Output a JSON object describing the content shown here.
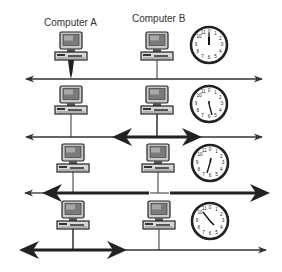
{
  "labels": {
    "computer_a": "Computer A",
    "computer_b": "Computer B"
  },
  "rows": [
    {
      "index": 1,
      "clock_hand": "12",
      "signal": "Computer A transmits"
    },
    {
      "index": 2,
      "clock_hand": "5",
      "signal": "Signal spreading from Computer B"
    },
    {
      "index": 3,
      "clock_hand": "7",
      "signal": "Signals cover whole cable"
    },
    {
      "index": 4,
      "clock_hand": "10-11",
      "signal": "Signal reaching Computer A"
    }
  ],
  "clock_numbers": [
    "1",
    "2",
    "3",
    "4",
    "5",
    "6",
    "7",
    "8",
    "9",
    "10",
    "11",
    "0"
  ],
  "colors": {
    "line": "#3a3a3a",
    "monitor_screen": "#8c8c8c",
    "monitor_body": "#d0d0d0",
    "dark": "#222222"
  }
}
